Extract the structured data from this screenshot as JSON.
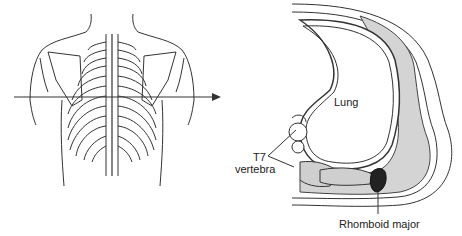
{
  "figure": {
    "left_panel": {
      "title": "Posterior view of thorax",
      "arrow_direction": "right"
    },
    "right_panel": {
      "title": "Transverse section at T7",
      "labels": {
        "lung": "Lung",
        "vertebra_line1": "T7",
        "vertebra_line2": "vertebra",
        "muscle": "Rhomboid major"
      }
    },
    "colors": {
      "line": "#333333",
      "muscle_fill": "#c9c9c9",
      "rhomboid_fill": "#222222",
      "background": "#ffffff"
    }
  }
}
